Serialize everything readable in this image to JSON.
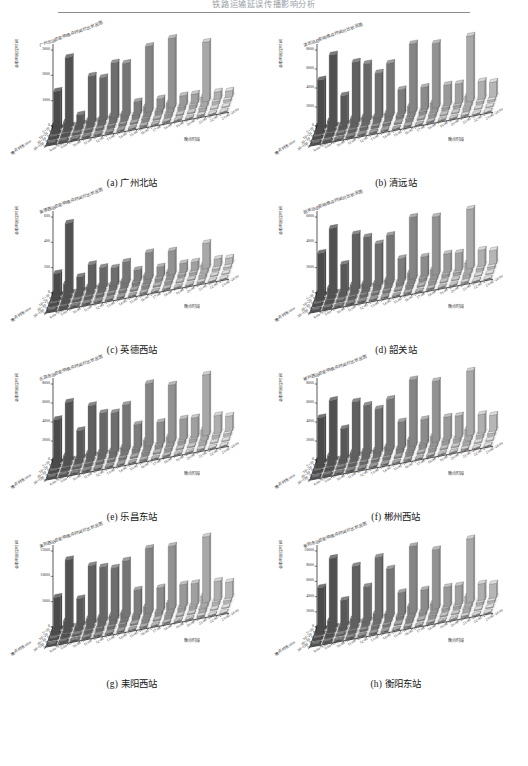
{
  "header": {
    "text": "铁路运输延误传播影响分析"
  },
  "figure": {
    "axes": {
      "y_title": "总影响延误时间",
      "depth_title": "晚点时长/min",
      "time_title": "晚点时段",
      "depth_categories": [
        "5~10",
        "10~20",
        "20~30",
        "30~100"
      ],
      "time_categories": [
        "8:00~9:00",
        "9:00~10:00",
        "10:00~11:00",
        "11:00~12:00",
        "12:00~13:00",
        "13:00~14:00",
        "14:00~15:00",
        "15:00~16:00",
        "16:00~17:00",
        "17:00~18:00",
        "18:00~19:00",
        "19:00~20:00",
        "20:00~21:00",
        "21:00~22:00",
        "22:00~23:00",
        "23:00~24:00"
      ]
    },
    "panels": [
      {
        "caption": "(a) 广州北站",
        "chart_title": "广州北站总影响晚点时间对比状况图",
        "yticks": [
          0,
          1000,
          2000,
          3000
        ],
        "ymax": 3000
      },
      {
        "caption": "(b) 清远站",
        "chart_title": "清远站总影响晚点时间对比状况图",
        "yticks": [
          0,
          2000,
          4000,
          6000,
          8000
        ],
        "ymax": 8000
      },
      {
        "caption": "(c) 英德西站",
        "chart_title": "英德西站总影响晚点时间对比状况图",
        "yticks": [
          0,
          200,
          400,
          600
        ],
        "ymax": 600
      },
      {
        "caption": "(d) 韶关站",
        "chart_title": "韶关站总影响晚点时间对比状况图",
        "yticks": [
          0,
          2000,
          4000,
          6000
        ],
        "ymax": 6000
      },
      {
        "caption": "(e) 乐昌东站",
        "chart_title": "乐昌东站总影响晚点时间对比状况图",
        "yticks": [
          0,
          2000,
          4000,
          6000,
          8000
        ],
        "ymax": 8000
      },
      {
        "caption": "(f) 郴州西站",
        "chart_title": "郴州西站总影响晚点时间对比状况图",
        "yticks": [
          0,
          2000,
          4000,
          6000,
          8000
        ],
        "ymax": 8000
      },
      {
        "caption": "(g) 耒阳西站",
        "chart_title": "耒阳西站总影响晚点时间对比状况图",
        "yticks": [
          0,
          5000,
          10000,
          15000
        ],
        "ymax": 15000
      },
      {
        "caption": "(h) 衡阳东站",
        "chart_title": "衡阳东站总影响晚点时间对比状况图",
        "yticks": [
          0,
          2000,
          4000,
          6000,
          8000,
          10000
        ],
        "ymax": 10000
      }
    ]
  },
  "chart_data": [
    {
      "type": "bar",
      "title": "广州北站总影响晚点时间对比状况图",
      "caption": "(a) 广州北站",
      "xlabel": "晚点时段",
      "ylabel": "总影响延误时间",
      "zlabel": "晚点时长/min",
      "ylim": [
        0,
        3000
      ],
      "categories": [
        "8:00~9:00",
        "9:00~10:00",
        "10:00~11:00",
        "11:00~12:00",
        "12:00~13:00",
        "13:00~14:00",
        "14:00~15:00",
        "15:00~16:00",
        "16:00~17:00",
        "17:00~18:00",
        "18:00~19:00",
        "19:00~20:00",
        "20:00~21:00",
        "21:00~22:00",
        "22:00~23:00",
        "23:00~24:00"
      ],
      "series": [
        {
          "name": "5~10",
          "values": [
            1500,
            2750,
            400,
            1850,
            1700,
            2200,
            2100,
            500,
            2600,
            450,
            2750,
            400,
            380,
            2350,
            300,
            250
          ]
        },
        {
          "name": "10~20",
          "values": [
            350,
            400,
            200,
            300,
            260,
            320,
            300,
            180,
            420,
            160,
            400,
            150,
            140,
            380,
            120,
            100
          ]
        },
        {
          "name": "20~30",
          "values": [
            120,
            150,
            80,
            110,
            95,
            120,
            110,
            70,
            150,
            60,
            150,
            55,
            50,
            140,
            45,
            35
          ]
        },
        {
          "name": "30~100",
          "values": [
            60,
            70,
            40,
            55,
            48,
            60,
            55,
            35,
            75,
            30,
            75,
            28,
            25,
            70,
            22,
            18
          ]
        }
      ]
    },
    {
      "type": "bar",
      "title": "清远站总影响晚点时间对比状况图",
      "caption": "(b) 清远站",
      "xlabel": "晚点时段",
      "ylabel": "总影响延误时间",
      "zlabel": "晚点时长/min",
      "ylim": [
        0,
        8000
      ],
      "categories": [
        "8:00~9:00",
        "9:00~10:00",
        "10:00~11:00",
        "11:00~12:00",
        "12:00~13:00",
        "13:00~14:00",
        "14:00~15:00",
        "15:00~16:00",
        "16:00~17:00",
        "17:00~18:00",
        "18:00~19:00",
        "19:00~20:00",
        "20:00~21:00",
        "21:00~22:00",
        "22:00~23:00",
        "23:00~24:00"
      ],
      "series": [
        {
          "name": "5~10",
          "values": [
            5200,
            7600,
            3100,
            6400,
            6000,
            4800,
            5600,
            2600,
            7200,
            2400,
            6800,
            2200,
            2100,
            6900,
            1900,
            1600
          ]
        },
        {
          "name": "10~20",
          "values": [
            900,
            1200,
            500,
            1000,
            950,
            750,
            880,
            420,
            1150,
            380,
            1080,
            350,
            330,
            1100,
            300,
            250
          ]
        },
        {
          "name": "20~30",
          "values": [
            320,
            430,
            180,
            360,
            340,
            270,
            310,
            150,
            410,
            135,
            385,
            125,
            118,
            395,
            107,
            89
          ]
        },
        {
          "name": "30~100",
          "values": [
            150,
            200,
            85,
            170,
            160,
            125,
            145,
            70,
            190,
            63,
            180,
            58,
            55,
            185,
            50,
            42
          ]
        }
      ]
    },
    {
      "type": "bar",
      "title": "英德西站总影响晚点时间对比状况图",
      "caption": "(c) 英德西站",
      "xlabel": "晚点时段",
      "ylabel": "总影响延误时间",
      "zlabel": "晚点时长/min",
      "ylim": [
        0,
        600
      ],
      "categories": [
        "8:00~9:00",
        "9:00~10:00",
        "10:00~11:00",
        "11:00~12:00",
        "12:00~13:00",
        "13:00~14:00",
        "14:00~15:00",
        "15:00~16:00",
        "16:00~17:00",
        "17:00~18:00",
        "18:00~19:00",
        "19:00~20:00",
        "20:00~21:00",
        "21:00~22:00",
        "22:00~23:00",
        "23:00~24:00"
      ],
      "series": [
        {
          "name": "5~10",
          "values": [
            180,
            560,
            120,
            200,
            160,
            140,
            170,
            90,
            210,
            80,
            190,
            75,
            70,
            200,
            60,
            50
          ]
        },
        {
          "name": "10~20",
          "values": [
            60,
            120,
            40,
            65,
            55,
            48,
            58,
            30,
            70,
            27,
            65,
            25,
            24,
            68,
            20,
            17
          ]
        },
        {
          "name": "20~30",
          "values": [
            25,
            50,
            17,
            27,
            23,
            20,
            24,
            13,
            29,
            11,
            27,
            10,
            10,
            28,
            8,
            7
          ]
        },
        {
          "name": "30~100",
          "values": [
            12,
            25,
            8,
            13,
            11,
            10,
            12,
            6,
            14,
            5,
            13,
            5,
            5,
            14,
            4,
            3
          ]
        }
      ]
    },
    {
      "type": "bar",
      "title": "韶关站总影响晚点时间对比状况图",
      "caption": "(d) 韶关站",
      "xlabel": "晚点时段",
      "ylabel": "总影响延误时间",
      "zlabel": "晚点时长/min",
      "ylim": [
        0,
        6000
      ],
      "categories": [
        "8:00~9:00",
        "9:00~10:00",
        "10:00~11:00",
        "11:00~12:00",
        "12:00~13:00",
        "13:00~14:00",
        "14:00~15:00",
        "15:00~16:00",
        "16:00~17:00",
        "17:00~18:00",
        "18:00~19:00",
        "19:00~20:00",
        "20:00~21:00",
        "21:00~22:00",
        "22:00~23:00",
        "23:00~24:00"
      ],
      "series": [
        {
          "name": "5~10",
          "values": [
            3400,
            5200,
            2200,
            4400,
            4000,
            3300,
            3800,
            1800,
            4900,
            1600,
            4600,
            1500,
            1400,
            4700,
            1300,
            1100
          ]
        },
        {
          "name": "10~20",
          "values": [
            620,
            900,
            400,
            800,
            730,
            600,
            690,
            330,
            890,
            290,
            830,
            270,
            255,
            855,
            235,
            200
          ]
        },
        {
          "name": "20~30",
          "values": [
            220,
            320,
            140,
            285,
            260,
            215,
            245,
            118,
            315,
            103,
            295,
            96,
            90,
            305,
            84,
            71
          ]
        },
        {
          "name": "30~100",
          "values": [
            105,
            150,
            67,
            135,
            123,
            102,
            116,
            56,
            150,
            49,
            140,
            45,
            43,
            145,
            40,
            34
          ]
        }
      ]
    },
    {
      "type": "bar",
      "title": "乐昌东站总影响晚点时间对比状况图",
      "caption": "(e) 乐昌东站",
      "xlabel": "晚点时段",
      "ylabel": "总影响延误时间",
      "zlabel": "晚点时长/min",
      "ylim": [
        0,
        8000
      ],
      "categories": [
        "8:00~9:00",
        "9:00~10:00",
        "10:00~11:00",
        "11:00~12:00",
        "12:00~13:00",
        "13:00~14:00",
        "14:00~15:00",
        "15:00~16:00",
        "16:00~17:00",
        "17:00~18:00",
        "18:00~19:00",
        "19:00~20:00",
        "20:00~21:00",
        "21:00~22:00",
        "22:00~23:00",
        "23:00~24:00"
      ],
      "series": [
        {
          "name": "5~10",
          "values": [
            4600,
            6200,
            3000,
            5400,
            4400,
            4200,
            4800,
            2500,
            6600,
            2300,
            6000,
            2200,
            2100,
            6400,
            1900,
            1600
          ]
        },
        {
          "name": "10~20",
          "values": [
            820,
            1080,
            540,
            960,
            790,
            750,
            855,
            450,
            1160,
            410,
            1060,
            395,
            375,
            1135,
            340,
            290
          ]
        },
        {
          "name": "20~30",
          "values": [
            290,
            385,
            192,
            342,
            281,
            267,
            304,
            160,
            412,
            146,
            378,
            141,
            133,
            404,
            121,
            103
          ]
        },
        {
          "name": "30~100",
          "values": [
            138,
            183,
            91,
            163,
            134,
            127,
            145,
            76,
            196,
            69,
            180,
            67,
            63,
            192,
            58,
            49
          ]
        }
      ]
    },
    {
      "type": "bar",
      "title": "郴州西站总影响晚点时间对比状况图",
      "caption": "(f) 郴州西站",
      "xlabel": "晚点时段",
      "ylabel": "总影响延误时间",
      "zlabel": "晚点时长/min",
      "ylim": [
        0,
        8000
      ],
      "categories": [
        "8:00~9:00",
        "9:00~10:00",
        "10:00~11:00",
        "11:00~12:00",
        "12:00~13:00",
        "13:00~14:00",
        "14:00~15:00",
        "15:00~16:00",
        "16:00~17:00",
        "17:00~18:00",
        "18:00~19:00",
        "19:00~20:00",
        "20:00~21:00",
        "21:00~22:00",
        "22:00~23:00",
        "23:00~24:00"
      ],
      "series": [
        {
          "name": "5~10",
          "values": [
            4800,
            6400,
            3200,
            5800,
            5200,
            4600,
            5400,
            2800,
            7000,
            2600,
            6400,
            2400,
            2300,
            6800,
            2000,
            1700
          ]
        },
        {
          "name": "10~20",
          "values": [
            855,
            1115,
            570,
            1030,
            925,
            820,
            960,
            500,
            1230,
            465,
            1130,
            430,
            410,
            1200,
            360,
            305
          ]
        },
        {
          "name": "20~30",
          "values": [
            302,
            396,
            202,
            366,
            328,
            291,
            341,
            178,
            437,
            165,
            401,
            153,
            146,
            426,
            128,
            108
          ]
        },
        {
          "name": "30~100",
          "values": [
            144,
            189,
            96,
            174,
            156,
            138,
            162,
            85,
            208,
            78,
            191,
            73,
            69,
            203,
            61,
            52
          ]
        }
      ]
    },
    {
      "type": "bar",
      "title": "耒阳西站总影响晚点时间对比状况图",
      "caption": "(g) 耒阳西站",
      "xlabel": "晚点时段",
      "ylabel": "总影响延误时间",
      "zlabel": "晚点时长/min",
      "ylim": [
        0,
        15000
      ],
      "categories": [
        "8:00~9:00",
        "9:00~10:00",
        "10:00~11:00",
        "11:00~12:00",
        "12:00~13:00",
        "13:00~14:00",
        "14:00~15:00",
        "15:00~16:00",
        "16:00~17:00",
        "17:00~18:00",
        "18:00~19:00",
        "19:00~20:00",
        "20:00~21:00",
        "21:00~22:00",
        "22:00~23:00",
        "23:00~24:00"
      ],
      "series": [
        {
          "name": "5~10",
          "values": [
            6500,
            13500,
            5400,
            11500,
            10800,
            10200,
            11200,
            5000,
            12800,
            4600,
            12400,
            4400,
            4200,
            13000,
            3800,
            3200
          ]
        },
        {
          "name": "10~20",
          "values": [
            1160,
            2400,
            960,
            2050,
            1920,
            1815,
            1995,
            890,
            2280,
            820,
            2205,
            785,
            750,
            2315,
            675,
            570
          ]
        },
        {
          "name": "20~30",
          "values": [
            410,
            850,
            340,
            725,
            680,
            642,
            706,
            315,
            806,
            290,
            780,
            278,
            265,
            819,
            239,
            202
          ]
        },
        {
          "name": "30~100",
          "values": [
            195,
            405,
            162,
            345,
            324,
            306,
            336,
            150,
            384,
            138,
            372,
            132,
            126,
            390,
            114,
            96
          ]
        }
      ]
    },
    {
      "type": "bar",
      "title": "衡阳东站总影响晚点时间对比状况图",
      "caption": "(h) 衡阳东站",
      "xlabel": "晚点时段",
      "ylabel": "总影响延误时间",
      "zlabel": "晚点时长/min",
      "ylim": [
        0,
        10000
      ],
      "categories": [
        "8:00~9:00",
        "9:00~10:00",
        "10:00~11:00",
        "11:00~12:00",
        "12:00~13:00",
        "13:00~14:00",
        "14:00~15:00",
        "15:00~16:00",
        "16:00~17:00",
        "17:00~18:00",
        "18:00~19:00",
        "19:00~20:00",
        "20:00~21:00",
        "21:00~22:00",
        "22:00~23:00",
        "23:00~24:00"
      ],
      "series": [
        {
          "name": "5~10",
          "values": [
            5600,
            9200,
            3400,
            7600,
            4600,
            8200,
            6400,
            3000,
            8800,
            2800,
            7800,
            2600,
            2500,
            8400,
            2200,
            1900
          ]
        },
        {
          "name": "10~20",
          "values": [
            1000,
            1640,
            610,
            1355,
            820,
            1460,
            1140,
            535,
            1570,
            500,
            1390,
            465,
            445,
            1495,
            390,
            340
          ]
        },
        {
          "name": "20~30",
          "values": [
            353,
            580,
            215,
            479,
            290,
            517,
            403,
            189,
            555,
            177,
            492,
            164,
            157,
            529,
            138,
            120
          ]
        },
        {
          "name": "30~100",
          "values": [
            168,
            276,
            102,
            228,
            138,
            246,
            192,
            90,
            264,
            84,
            234,
            78,
            75,
            252,
            66,
            57
          ]
        }
      ]
    }
  ]
}
